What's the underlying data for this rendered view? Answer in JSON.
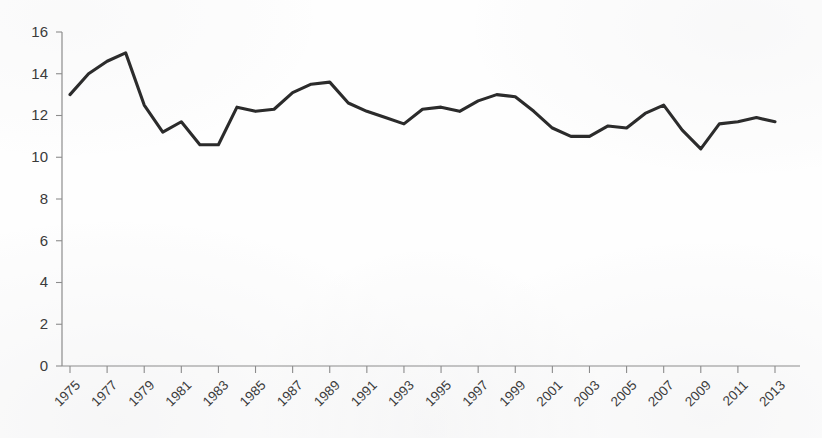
{
  "chart_data": {
    "type": "line",
    "title": "",
    "subtitle": "",
    "xlabel": "",
    "ylabel": "",
    "ylim": [
      0,
      16
    ],
    "xlim": [
      1975,
      2013
    ],
    "grid": false,
    "legend": false,
    "legend_position": "none",
    "line_color": "#2b2b2b",
    "axis_color": "#8d8d8d",
    "background_color": "#ffffff",
    "y_ticks": [
      0,
      2,
      4,
      6,
      8,
      10,
      12,
      14,
      16
    ],
    "y_tick_labels": [
      "0",
      "2",
      "4",
      "6",
      "8",
      "10",
      "12",
      "14",
      "16"
    ],
    "x_tick_labels": [
      "1975",
      "1977",
      "1979",
      "1981",
      "1983",
      "1985",
      "1987",
      "1989",
      "1991",
      "1993",
      "1995",
      "1997",
      "1999",
      "2001",
      "2003",
      "2005",
      "2007",
      "2009",
      "2011",
      "2013"
    ],
    "x_tick_label_rotation": -45,
    "x": [
      1975,
      1976,
      1977,
      1978,
      1979,
      1980,
      1981,
      1982,
      1983,
      1984,
      1985,
      1986,
      1987,
      1988,
      1989,
      1990,
      1991,
      1992,
      1993,
      1994,
      1995,
      1996,
      1997,
      1998,
      1999,
      2000,
      2001,
      2002,
      2003,
      2004,
      2005,
      2006,
      2007,
      2008,
      2009,
      2010,
      2011,
      2012,
      2013
    ],
    "values": [
      13.0,
      14.0,
      14.6,
      15.0,
      12.5,
      11.2,
      11.7,
      10.6,
      10.6,
      12.4,
      12.2,
      12.3,
      13.1,
      13.5,
      13.6,
      12.6,
      12.2,
      11.9,
      11.6,
      12.3,
      12.4,
      12.2,
      12.7,
      13.0,
      12.9,
      12.2,
      11.4,
      11.0,
      11.0,
      11.5,
      11.4,
      12.1,
      12.5,
      11.3,
      10.4,
      11.6,
      11.7,
      11.9,
      11.7
    ],
    "series": [
      {
        "name": "series-1",
        "values": [
          13.0,
          14.0,
          14.6,
          15.0,
          12.5,
          11.2,
          11.7,
          10.6,
          10.6,
          12.4,
          12.2,
          12.3,
          13.1,
          13.5,
          13.6,
          12.6,
          12.2,
          11.9,
          11.6,
          12.3,
          12.4,
          12.2,
          12.7,
          13.0,
          12.9,
          12.2,
          11.4,
          11.0,
          11.0,
          11.5,
          11.4,
          12.1,
          12.5,
          11.3,
          10.4,
          11.6,
          11.7,
          11.9,
          11.7
        ]
      }
    ]
  }
}
